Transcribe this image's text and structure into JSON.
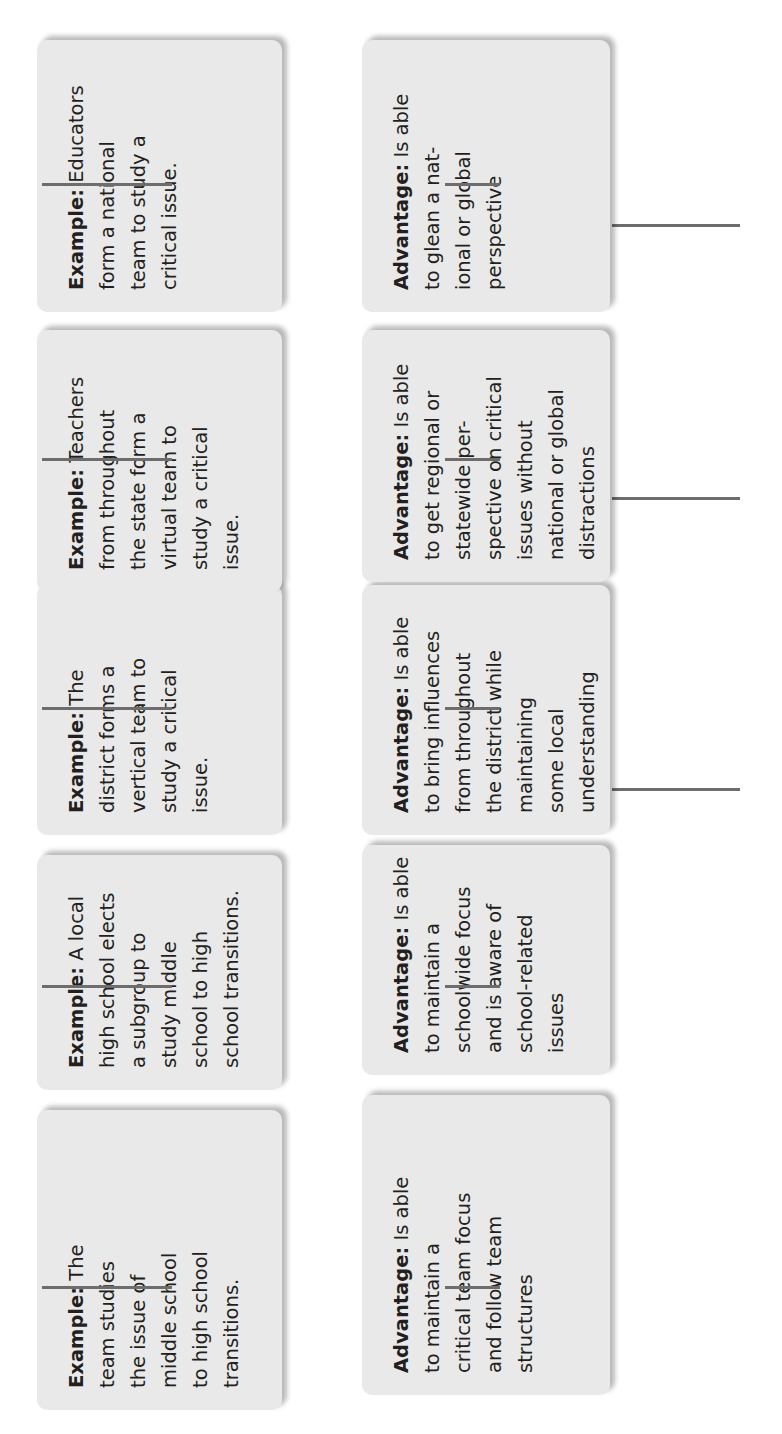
{
  "diagram": {
    "orientation": "rotated-90-ccw",
    "colors": {
      "box_fill": "#e9e9e9",
      "connector": "#6d6d6d",
      "text": "#231f20"
    },
    "columns": [
      {
        "advantage": {
          "label": "Advantage:",
          "lines": [
            "Is able",
            "to maintain a",
            "critical team focus",
            "and follow team",
            "structures"
          ]
        },
        "example": {
          "label": "Example:",
          "lines": [
            "The",
            "team studies",
            "the issue of",
            "middle school",
            "to high school",
            "transitions."
          ]
        }
      },
      {
        "advantage": {
          "label": "Advantage:",
          "lines": [
            "Is able",
            "to maintain a",
            "schoolwide focus",
            "and is aware of",
            "school-related",
            "issues"
          ]
        },
        "example": {
          "label": "Example:",
          "lines": [
            "A local",
            "high school elects",
            "a subgroup to",
            "study middle",
            "school to high",
            "school transitions."
          ]
        }
      },
      {
        "advantage": {
          "label": "Advantage:",
          "lines": [
            "Is able",
            "to bring influences",
            "from throughout",
            "the district while",
            "maintaining",
            "some local",
            "understanding"
          ]
        },
        "example": {
          "label": "Example:",
          "lines": [
            "The",
            "district forms a",
            "vertical team to",
            "study a critical",
            "issue."
          ]
        }
      },
      {
        "advantage": {
          "label": "Advantage:",
          "lines": [
            "Is able",
            "to get regional or",
            "statewide per-",
            "spective on critical",
            "issues without",
            "national or global",
            "distractions"
          ]
        },
        "example": {
          "label": "Example:",
          "lines": [
            "Teachers",
            "from throughout",
            "the state form a",
            "virtual team to",
            "study a critical",
            "issue."
          ]
        }
      },
      {
        "advantage": {
          "label": "Advantage:",
          "lines": [
            "Is able",
            "to glean a nat-",
            "ional or global",
            "perspective"
          ]
        },
        "example": {
          "label": "Example:",
          "lines": [
            "Educators",
            "form a national",
            "team to study a",
            "critical issue."
          ]
        }
      }
    ]
  }
}
